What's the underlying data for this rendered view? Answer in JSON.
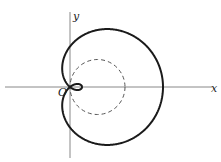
{
  "diagram": {
    "type": "polar-curve",
    "curve": "limacon with inner loop",
    "labels": {
      "x_axis": "x",
      "y_axis": "y",
      "origin": "O"
    },
    "origin_px": [
      70,
      87
    ],
    "limacon": {
      "a": 52.5,
      "b": 40.5,
      "stroke": "#1a1a1a",
      "stroke_width": 2
    },
    "dashed_circle": {
      "cx": 97.5,
      "cy": 87,
      "r": 27.5,
      "stroke": "#555555",
      "dash": "4 3"
    },
    "axes": {
      "x_from": 5,
      "x_to": 212,
      "y_from": 12,
      "y_to": 158,
      "color": "#888888"
    }
  }
}
